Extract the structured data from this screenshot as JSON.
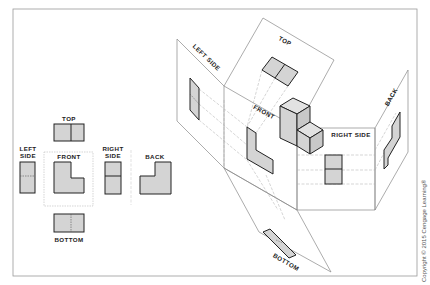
{
  "flat_views": {
    "top": "TOP",
    "left_side_1": "LEFT",
    "left_side_2": "SIDE",
    "front": "FRONT",
    "right_side_1": "RIGHT",
    "right_side_2": "SIDE",
    "back": "BACK",
    "bottom": "BOTTOM"
  },
  "glass_box": {
    "top": "TOP",
    "left_side": "LEFT SIDE",
    "front": "FRONT",
    "right_side": "RIGHT SIDE",
    "back": "BACK",
    "bottom": "BOTTOM"
  },
  "copyright": "Copyright © 2015 Cengage Learning®",
  "colors": {
    "fill": "#d4d4d4",
    "outline": "#222222",
    "plane": "#888888",
    "projection": "#aaaaaa"
  }
}
